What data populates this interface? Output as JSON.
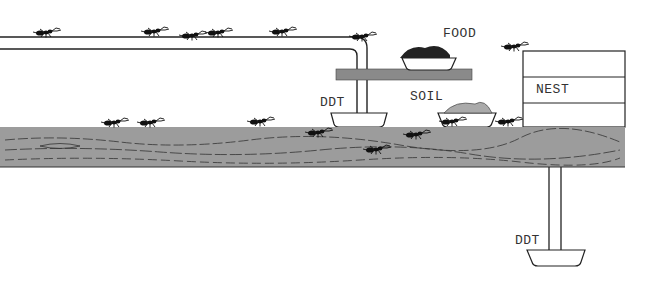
{
  "diagram": {
    "labels": {
      "food": "FOOD",
      "soil": "SOIL",
      "nest": "NEST",
      "ddt_upper": "DDT",
      "ddt_lower": "DDT"
    },
    "colors": {
      "ground": "#9c9c9c",
      "shelf": "#8a8a8a",
      "ink": "#1a1a1a"
    }
  }
}
